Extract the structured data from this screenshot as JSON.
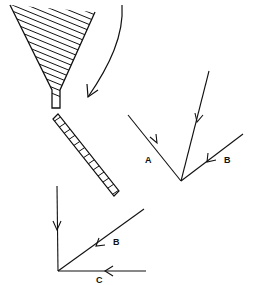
{
  "diagram": {
    "colors": {
      "ink": "#111111",
      "background": "#ffffff"
    },
    "upper_vertex": {
      "labels": {
        "a": "A",
        "b": "B"
      }
    },
    "lower_vertex": {
      "labels": {
        "b": "B",
        "c": "C"
      }
    }
  }
}
